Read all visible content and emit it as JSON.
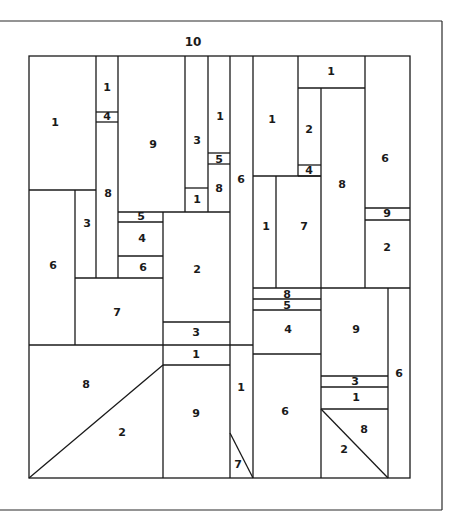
{
  "diagram": {
    "type": "paint-by-number color block pattern",
    "border_label": {
      "text": "10",
      "x": 193,
      "y": 42
    },
    "outer_frame": [
      [
        0,
        21,
        442,
        21
      ],
      [
        442,
        21,
        442,
        510
      ],
      [
        0,
        510,
        442,
        510
      ]
    ],
    "inner_frame": {
      "x": 29,
      "y": 56,
      "w": 381,
      "h": 422
    },
    "segments": [
      [
        96,
        56,
        96,
        278
      ],
      [
        118,
        56,
        118,
        212
      ],
      [
        185,
        56,
        185,
        212
      ],
      [
        208,
        56,
        208,
        212
      ],
      [
        230,
        56,
        230,
        478
      ],
      [
        253,
        56,
        253,
        478
      ],
      [
        298,
        56,
        298,
        176
      ],
      [
        365,
        56,
        365,
        288
      ],
      [
        298,
        88,
        365,
        88
      ],
      [
        321,
        88,
        321,
        288
      ],
      [
        298,
        165,
        321,
        165
      ],
      [
        298,
        176,
        321,
        176
      ],
      [
        253,
        176,
        321,
        176
      ],
      [
        276,
        176,
        276,
        288
      ],
      [
        365,
        208,
        410,
        208
      ],
      [
        365,
        220,
        410,
        220
      ],
      [
        253,
        288,
        410,
        288
      ],
      [
        96,
        112,
        118,
        112
      ],
      [
        96,
        122,
        118,
        122
      ],
      [
        29,
        190,
        96,
        190
      ],
      [
        75,
        190,
        75,
        345
      ],
      [
        208,
        153,
        230,
        153
      ],
      [
        208,
        164,
        230,
        164
      ],
      [
        185,
        188,
        208,
        188
      ],
      [
        163,
        212,
        163,
        478
      ],
      [
        118,
        212,
        230,
        212
      ],
      [
        118,
        222,
        163,
        222
      ],
      [
        118,
        256,
        163,
        256
      ],
      [
        118,
        212,
        118,
        278
      ],
      [
        75,
        278,
        163,
        278
      ],
      [
        163,
        322,
        230,
        322
      ],
      [
        29,
        345,
        253,
        345
      ],
      [
        163,
        365,
        230,
        365
      ],
      [
        29,
        478,
        163,
        365
      ],
      [
        253,
        299,
        321,
        299
      ],
      [
        253,
        310,
        321,
        310
      ],
      [
        253,
        354,
        321,
        354
      ],
      [
        321,
        288,
        321,
        478
      ],
      [
        388,
        288,
        388,
        478
      ],
      [
        321,
        376,
        388,
        376
      ],
      [
        321,
        387,
        388,
        387
      ],
      [
        321,
        409,
        388,
        409
      ],
      [
        321,
        409,
        388,
        478
      ],
      [
        230,
        433,
        253,
        478
      ]
    ],
    "labels": [
      {
        "text": "1",
        "x": 55,
        "y": 123
      },
      {
        "text": "1",
        "x": 107,
        "y": 88
      },
      {
        "text": "4",
        "x": 107,
        "y": 117
      },
      {
        "text": "8",
        "x": 108,
        "y": 194
      },
      {
        "text": "9",
        "x": 153,
        "y": 145
      },
      {
        "text": "3",
        "x": 197,
        "y": 141
      },
      {
        "text": "1",
        "x": 197,
        "y": 200
      },
      {
        "text": "1",
        "x": 220,
        "y": 117
      },
      {
        "text": "5",
        "x": 219,
        "y": 160
      },
      {
        "text": "8",
        "x": 219,
        "y": 189
      },
      {
        "text": "6",
        "x": 241,
        "y": 180
      },
      {
        "text": "1",
        "x": 272,
        "y": 120
      },
      {
        "text": "1",
        "x": 331,
        "y": 72
      },
      {
        "text": "2",
        "x": 309,
        "y": 130
      },
      {
        "text": "4",
        "x": 309,
        "y": 171
      },
      {
        "text": "8",
        "x": 342,
        "y": 185
      },
      {
        "text": "6",
        "x": 385,
        "y": 159
      },
      {
        "text": "9",
        "x": 387,
        "y": 214
      },
      {
        "text": "2",
        "x": 387,
        "y": 248
      },
      {
        "text": "1",
        "x": 266,
        "y": 227
      },
      {
        "text": "7",
        "x": 304,
        "y": 227
      },
      {
        "text": "3",
        "x": 87,
        "y": 224
      },
      {
        "text": "6",
        "x": 53,
        "y": 266
      },
      {
        "text": "5",
        "x": 141,
        "y": 217
      },
      {
        "text": "4",
        "x": 142,
        "y": 239
      },
      {
        "text": "6",
        "x": 143,
        "y": 268
      },
      {
        "text": "2",
        "x": 197,
        "y": 270
      },
      {
        "text": "7",
        "x": 117,
        "y": 313
      },
      {
        "text": "3",
        "x": 196,
        "y": 333
      },
      {
        "text": "1",
        "x": 196,
        "y": 355
      },
      {
        "text": "8",
        "x": 86,
        "y": 385
      },
      {
        "text": "2",
        "x": 122,
        "y": 433
      },
      {
        "text": "9",
        "x": 196,
        "y": 414
      },
      {
        "text": "1",
        "x": 241,
        "y": 388
      },
      {
        "text": "7",
        "x": 238,
        "y": 465
      },
      {
        "text": "8",
        "x": 287,
        "y": 295
      },
      {
        "text": "5",
        "x": 287,
        "y": 306
      },
      {
        "text": "4",
        "x": 288,
        "y": 330
      },
      {
        "text": "9",
        "x": 356,
        "y": 330
      },
      {
        "text": "6",
        "x": 399,
        "y": 374
      },
      {
        "text": "3",
        "x": 355,
        "y": 382
      },
      {
        "text": "1",
        "x": 356,
        "y": 398
      },
      {
        "text": "6",
        "x": 285,
        "y": 412
      },
      {
        "text": "8",
        "x": 364,
        "y": 430
      },
      {
        "text": "2",
        "x": 344,
        "y": 450
      }
    ]
  }
}
